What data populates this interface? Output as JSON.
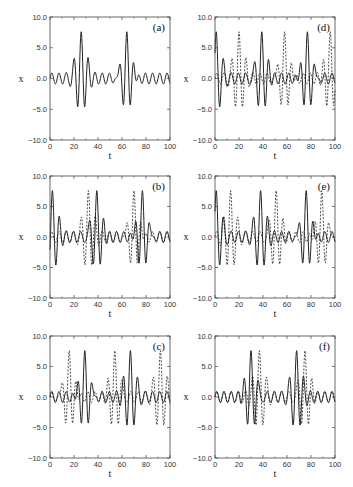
{
  "figure": {
    "title": ""
  },
  "chart_data": [
    {
      "panel": "(a)",
      "type": "line",
      "xlabel": "t",
      "ylabel": "x",
      "xlim": [
        0,
        100
      ],
      "ylim": [
        -10,
        10
      ],
      "xticks": [
        "0",
        "20",
        "40",
        "60",
        "80",
        "100"
      ],
      "yticks": [
        "-10.0",
        "-5.0",
        "0.0",
        "5.0",
        "10.0"
      ],
      "series": [
        {
          "name": "solid",
          "style": "solid",
          "bursts": [
            26,
            64
          ],
          "peak": 7.6,
          "trough": -5.7
        }
      ]
    },
    {
      "panel": "(b)",
      "type": "line",
      "xlabel": "t",
      "ylabel": "x",
      "xlim": [
        0,
        100
      ],
      "ylim": [
        -10,
        10
      ],
      "xticks": [
        "0",
        "20",
        "40",
        "60",
        "80",
        "100"
      ],
      "yticks": [
        "-10.0",
        "-5.0",
        "0.0",
        "5.0",
        "10.0"
      ],
      "series": [
        {
          "name": "solid",
          "style": "solid",
          "bursts": [
            2,
            39,
            77
          ],
          "peak": 7.6,
          "trough": -5.7
        },
        {
          "name": "dashed",
          "style": "dashed",
          "bursts": [
            32,
            70
          ],
          "peak": 7.6,
          "trough": -5.7
        }
      ]
    },
    {
      "panel": "(c)",
      "type": "line",
      "xlabel": "t",
      "ylabel": "x",
      "xlim": [
        0,
        100
      ],
      "ylim": [
        -10,
        10
      ],
      "xticks": [
        "0",
        "20",
        "40",
        "60",
        "80",
        "100"
      ],
      "yticks": [
        "-10.0",
        "-5.0",
        "0.0",
        "5.0",
        "10.0"
      ],
      "series": [
        {
          "name": "solid",
          "style": "solid",
          "bursts": [
            29,
            67
          ],
          "peak": 7.6,
          "trough": -5.7
        },
        {
          "name": "dashed",
          "style": "dashed",
          "bursts": [
            16,
            54,
            92
          ],
          "peak": 7.6,
          "trough": -5.7
        }
      ]
    },
    {
      "panel": "(d)",
      "type": "line",
      "xlabel": "t",
      "ylabel": "x",
      "xlim": [
        0,
        100
      ],
      "ylim": [
        -10,
        10
      ],
      "xticks": [
        "0",
        "20",
        "40",
        "60",
        "80",
        "100"
      ],
      "yticks": [
        "-10.0",
        "-5.0",
        "0.0",
        "5.0",
        "10.0"
      ],
      "series": [
        {
          "name": "solid",
          "style": "solid",
          "bursts": [
            1,
            39,
            77
          ],
          "peak": 7.6,
          "trough": -5.7
        },
        {
          "name": "dashed",
          "style": "dashed",
          "bursts": [
            20,
            58,
            96
          ],
          "peak": 7.6,
          "trough": -5.7
        }
      ]
    },
    {
      "panel": "(e)",
      "type": "line",
      "xlabel": "t",
      "ylabel": "x",
      "xlim": [
        0,
        100
      ],
      "ylim": [
        -10,
        10
      ],
      "xticks": [
        "0",
        "20",
        "40",
        "60",
        "80",
        "100"
      ],
      "yticks": [
        "-10.0",
        "-5.0",
        "0.0",
        "5.0",
        "10.0"
      ],
      "series": [
        {
          "name": "solid",
          "style": "solid",
          "bursts": [
            1,
            38,
            76
          ],
          "peak": 7.6,
          "trough": -5.7
        },
        {
          "name": "dashed",
          "style": "dashed",
          "bursts": [
            13,
            51,
            89
          ],
          "peak": 7.6,
          "trough": -5.7
        }
      ]
    },
    {
      "panel": "(f)",
      "type": "line",
      "xlabel": "t",
      "ylabel": "x",
      "xlim": [
        0,
        100
      ],
      "ylim": [
        -10,
        10
      ],
      "xticks": [
        "0",
        "20",
        "40",
        "60",
        "80",
        "100"
      ],
      "yticks": [
        "-10.0",
        "-5.0",
        "0.0",
        "5.0",
        "10.0"
      ],
      "series": [
        {
          "name": "solid",
          "style": "solid",
          "bursts": [
            30,
            68
          ],
          "peak": 7.6,
          "trough": -5.7
        },
        {
          "name": "dashed",
          "style": "dashed",
          "bursts": [
            37,
            75
          ],
          "peak": 7.6,
          "trough": -5.7
        }
      ]
    }
  ]
}
